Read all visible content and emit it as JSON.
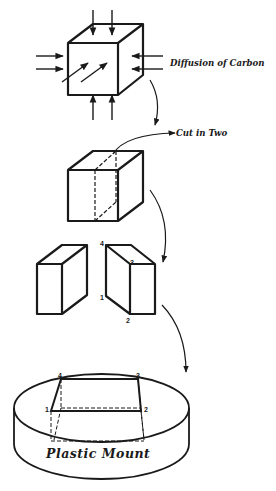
{
  "diagram": {
    "labels": {
      "diffusion": "Diffusion of Carbon",
      "cut": "Cut in Two",
      "mount": "Plastic Mount"
    },
    "vertex_labels": {
      "v1": "1",
      "v2": "2",
      "v3": "3",
      "v4": "4"
    },
    "steps": [
      {
        "id": "step-1",
        "shape": "cube",
        "annotation": "Diffusion of Carbon"
      },
      {
        "id": "step-2",
        "shape": "cube-with-cut-plane",
        "annotation": "Cut in Two"
      },
      {
        "id": "step-3",
        "shape": "two-halves",
        "annotation": "vertices 1-4 on cut face"
      },
      {
        "id": "step-4",
        "shape": "cylindrical-mount",
        "annotation": "Plastic Mount"
      }
    ],
    "colors": {
      "stroke": "#1a1a1a",
      "background": "#ffffff"
    }
  }
}
